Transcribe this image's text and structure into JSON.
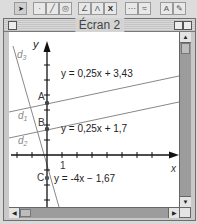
{
  "toolbar": {
    "buttons": [
      {
        "name": "pointer-tool",
        "icon": "arrow-pointer-icon",
        "glyph": "➤"
      },
      {
        "name": "point-tool",
        "icon": "point-icon",
        "glyph": "·"
      },
      {
        "name": "line-tool",
        "icon": "line-icon",
        "glyph": "╱"
      },
      {
        "name": "circle-tool",
        "icon": "circle-icon",
        "glyph": "◎"
      },
      {
        "name": "construct-tool",
        "icon": "angle-construct-icon",
        "glyph": "∠"
      },
      {
        "name": "transform-tool",
        "icon": "transform-icon",
        "glyph": "Λ"
      },
      {
        "name": "measure-tool",
        "icon": "x-measure-icon",
        "glyph": "X"
      },
      {
        "name": "macro-tool",
        "icon": "macro-icon",
        "glyph": "⋯"
      },
      {
        "name": "trace-tool",
        "icon": "trace-icon",
        "glyph": "≈"
      },
      {
        "name": "text-tool",
        "icon": "text-label-icon",
        "glyph": "A"
      },
      {
        "name": "draw-tool",
        "icon": "pen-icon",
        "glyph": "✎"
      }
    ]
  },
  "window": {
    "title": "Écran 2"
  },
  "graph": {
    "axis_x_label": "x",
    "axis_y_label": "y",
    "unit_label": "1",
    "points": [
      {
        "label": "A",
        "x": 0,
        "y": 3.43
      },
      {
        "label": "B",
        "x": 0,
        "y": 1.7
      },
      {
        "label": "C",
        "x": 0,
        "y": -1.67
      }
    ],
    "lines": [
      {
        "label": "d3",
        "equation": "y = 0,25x + 3,43"
      },
      {
        "label": "d1",
        "equation": "y = 0,25x + 1,7"
      },
      {
        "label": "d2",
        "equation": "y = -4x − 1,67"
      }
    ],
    "equation_labels": {
      "eq1": "y = 0,25x + 3,43",
      "eq2": "y = 0,25x + 1,7",
      "eq3": "y = -4x − 1,67"
    },
    "line_name_labels": {
      "d3": "d",
      "d3_sub": "3",
      "d1": "d",
      "d1_sub": "1",
      "d2": "d",
      "d2_sub": "2"
    }
  }
}
